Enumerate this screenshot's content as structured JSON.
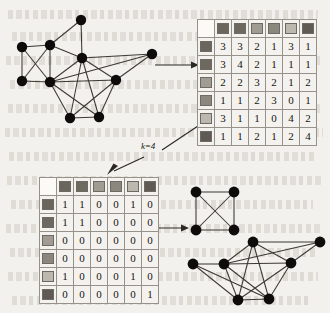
{
  "figure": {
    "background_color": "#f3f1ed",
    "ink_color": "#141210",
    "node_color": "#0d0c0b",
    "edge_color": "#3b3833",
    "grid_color": "#96928a",
    "caption_label_k": "k=4"
  },
  "graphs": {
    "input_graph": {
      "name": "input-graph",
      "node_count": 9,
      "nodes": [
        {
          "id": "n0",
          "x": 16,
          "y": 41
        },
        {
          "id": "n1",
          "x": 16,
          "y": 75
        },
        {
          "id": "n2",
          "x": 44,
          "y": 39
        },
        {
          "id": "n3",
          "x": 44,
          "y": 76
        },
        {
          "id": "n4",
          "x": 75,
          "y": 14
        },
        {
          "id": "n5",
          "x": 76,
          "y": 52
        },
        {
          "id": "n6",
          "x": 110,
          "y": 74
        },
        {
          "id": "n7",
          "x": 146,
          "y": 48
        },
        {
          "id": "n8",
          "x": 64,
          "y": 112
        },
        {
          "id": "n9",
          "x": 93,
          "y": 111
        }
      ],
      "edges": [
        [
          "n0",
          "n1"
        ],
        [
          "n0",
          "n2"
        ],
        [
          "n0",
          "n3"
        ],
        [
          "n1",
          "n2"
        ],
        [
          "n1",
          "n3"
        ],
        [
          "n2",
          "n3"
        ],
        [
          "n2",
          "n4"
        ],
        [
          "n2",
          "n5"
        ],
        [
          "n3",
          "n5"
        ],
        [
          "n3",
          "n6"
        ],
        [
          "n3",
          "n8"
        ],
        [
          "n3",
          "n9"
        ],
        [
          "n4",
          "n5"
        ],
        [
          "n5",
          "n6"
        ],
        [
          "n5",
          "n7"
        ],
        [
          "n5",
          "n8"
        ],
        [
          "n5",
          "n9"
        ],
        [
          "n6",
          "n7"
        ],
        [
          "n6",
          "n8"
        ],
        [
          "n6",
          "n9"
        ],
        [
          "n8",
          "n9"
        ],
        [
          "n3",
          "n7"
        ]
      ]
    },
    "clique_graph": {
      "name": "clique-graph-k4",
      "node_count": 4,
      "nodes": [
        {
          "id": "c0",
          "x": 10,
          "y": 10
        },
        {
          "id": "c1",
          "x": 48,
          "y": 10
        },
        {
          "id": "c2",
          "x": 10,
          "y": 48
        },
        {
          "id": "c3",
          "x": 48,
          "y": 48
        }
      ],
      "edges": [
        [
          "c0",
          "c1"
        ],
        [
          "c0",
          "c2"
        ],
        [
          "c0",
          "c3"
        ],
        [
          "c1",
          "c2"
        ],
        [
          "c1",
          "c3"
        ],
        [
          "c2",
          "c3"
        ]
      ]
    },
    "output_graph": {
      "name": "output-graph",
      "node_count": 8,
      "nodes": [
        {
          "id": "o0",
          "x": 12,
          "y": 32
        },
        {
          "id": "o1",
          "x": 43,
          "y": 32
        },
        {
          "id": "o2",
          "x": 72,
          "y": 10
        },
        {
          "id": "o3",
          "x": 110,
          "y": 31
        },
        {
          "id": "o4",
          "x": 139,
          "y": 10
        },
        {
          "id": "o5",
          "x": 57,
          "y": 68
        },
        {
          "id": "o6",
          "x": 88,
          "y": 67
        }
      ],
      "edges": [
        [
          "o0",
          "o1"
        ],
        [
          "o0",
          "o5"
        ],
        [
          "o0",
          "o6"
        ],
        [
          "o1",
          "o2"
        ],
        [
          "o1",
          "o3"
        ],
        [
          "o1",
          "o5"
        ],
        [
          "o1",
          "o6"
        ],
        [
          "o2",
          "o3"
        ],
        [
          "o2",
          "o4"
        ],
        [
          "o2",
          "o5"
        ],
        [
          "o2",
          "o6"
        ],
        [
          "o3",
          "o4"
        ],
        [
          "o3",
          "o5"
        ],
        [
          "o3",
          "o6"
        ],
        [
          "o5",
          "o6"
        ],
        [
          "o1",
          "o4"
        ]
      ]
    }
  },
  "matrices": {
    "similarity_matrix": {
      "name": "similarity-matrix",
      "header_colors": [
        "#6a665e",
        "#6d6961",
        "#a19c93",
        "#8c877e",
        "#bdb8af",
        "#5f5b54"
      ],
      "rows": [
        [
          3,
          3,
          2,
          1,
          3,
          1
        ],
        [
          3,
          4,
          2,
          1,
          1,
          1
        ],
        [
          2,
          2,
          3,
          2,
          1,
          2
        ],
        [
          1,
          1,
          2,
          3,
          0,
          1
        ],
        [
          3,
          1,
          1,
          0,
          4,
          2
        ],
        [
          1,
          1,
          2,
          1,
          2,
          4
        ]
      ]
    },
    "binary_matrix": {
      "name": "binary-matrix",
      "header_colors": [
        "#6a665e",
        "#6d6961",
        "#a19c93",
        "#8c877e",
        "#bdb8af",
        "#5f5b54"
      ],
      "rows": [
        [
          1,
          1,
          0,
          0,
          1,
          0
        ],
        [
          1,
          1,
          0,
          0,
          0,
          0
        ],
        [
          0,
          0,
          0,
          0,
          0,
          0
        ],
        [
          0,
          0,
          0,
          0,
          0,
          0
        ],
        [
          1,
          0,
          0,
          0,
          1,
          0
        ],
        [
          0,
          0,
          0,
          0,
          0,
          1
        ]
      ]
    }
  },
  "arrows": [
    {
      "name": "arrow-graph-to-matrix",
      "direction": "right"
    },
    {
      "name": "arrow-matrix-to-binary",
      "direction": "down-left"
    },
    {
      "name": "arrow-binary-to-clique",
      "direction": "right"
    }
  ]
}
